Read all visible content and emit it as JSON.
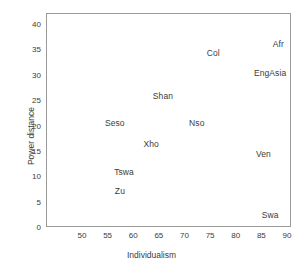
{
  "chart_data": {
    "type": "scatter",
    "title": "",
    "xlabel": "Individualism",
    "ylabel": "Power distance",
    "xlim": [
      46,
      92
    ],
    "ylim": [
      0,
      42
    ],
    "xticks": [
      50,
      55,
      60,
      65,
      70,
      75,
      80,
      85,
      90
    ],
    "xticklabels": [
      "50",
      "55",
      "60",
      "65",
      "70",
      "75",
      "80",
      "85",
      "90"
    ],
    "yticks": [
      0,
      5,
      10,
      15,
      20,
      25,
      30,
      35,
      40
    ],
    "yticklabels": [
      "0",
      "5",
      "10",
      "15",
      "20",
      "25",
      "30",
      "35",
      "40"
    ],
    "grid": false,
    "legend": null,
    "marker": "text-label-only",
    "points": [
      {
        "label": "Afr",
        "x": 88.3,
        "y": 36.1
      },
      {
        "label": "Col",
        "x": 75.6,
        "y": 34.3
      },
      {
        "label": "EngAsia",
        "x": 86.7,
        "y": 30.4
      },
      {
        "label": "Shan",
        "x": 65.8,
        "y": 25.8
      },
      {
        "label": "Seso",
        "x": 56.4,
        "y": 20.5
      },
      {
        "label": "Nso",
        "x": 72.4,
        "y": 20.5
      },
      {
        "label": "Xho",
        "x": 63.5,
        "y": 16.4
      },
      {
        "label": "Ven",
        "x": 85.4,
        "y": 14.4
      },
      {
        "label": "Tswa",
        "x": 58.2,
        "y": 10.8
      },
      {
        "label": "Zu",
        "x": 57.4,
        "y": 7.1
      },
      {
        "label": "Swa",
        "x": 86.7,
        "y": 2.4
      }
    ]
  }
}
